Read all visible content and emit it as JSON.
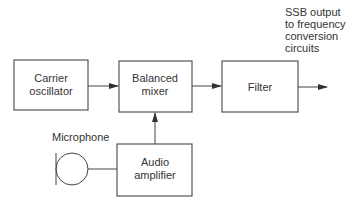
{
  "diagram": {
    "type": "block-diagram",
    "blocks": [
      {
        "id": "carrier",
        "lines": [
          "Carrier",
          "oscillator"
        ]
      },
      {
        "id": "mixer",
        "lines": [
          "Balanced",
          "mixer"
        ]
      },
      {
        "id": "filter",
        "lines": [
          "Filter"
        ]
      },
      {
        "id": "audio",
        "lines": [
          "Audio",
          "amplifier"
        ]
      }
    ],
    "microphone_label": "Microphone",
    "output_label": [
      "SSB output",
      "to frequency",
      "conversion",
      "circuits"
    ],
    "connections": [
      {
        "from": "carrier",
        "to": "mixer"
      },
      {
        "from": "mixer",
        "to": "filter"
      },
      {
        "from": "filter",
        "to": "output"
      },
      {
        "from": "audio",
        "to": "mixer"
      },
      {
        "from": "microphone",
        "to": "audio"
      }
    ],
    "colors": {
      "line": "#444444",
      "text": "#333333",
      "background": "#ffffff"
    }
  }
}
